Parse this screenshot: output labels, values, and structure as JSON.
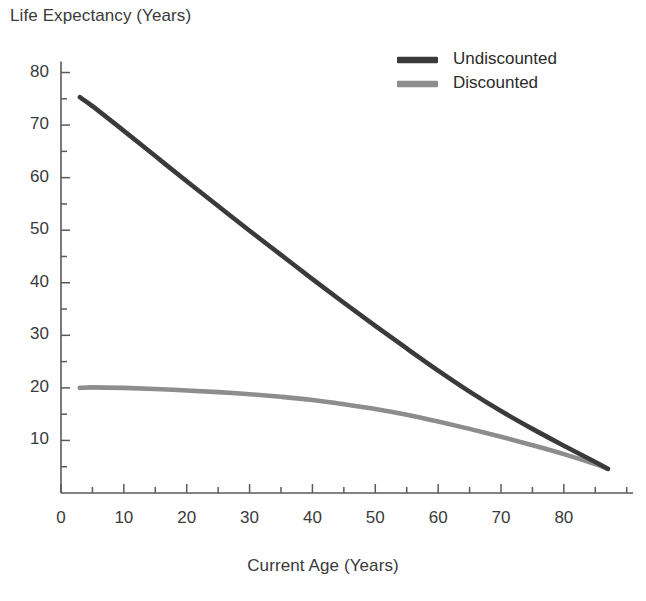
{
  "chart_data": {
    "type": "line",
    "title": "",
    "xlabel": "Current Age (Years)",
    "ylabel": "Life Expectancy (Years)",
    "xlim": [
      0,
      91
    ],
    "ylim": [
      0,
      82
    ],
    "xticks": [
      0,
      10,
      20,
      30,
      40,
      50,
      60,
      70,
      80
    ],
    "yticks": [
      10,
      20,
      30,
      40,
      50,
      60,
      70,
      80
    ],
    "xtick_minor_step": 5,
    "ytick_minor_step": 5,
    "grid": false,
    "legend_position": "top-right",
    "x": [
      3,
      5,
      10,
      15,
      20,
      25,
      30,
      35,
      40,
      45,
      50,
      55,
      60,
      65,
      70,
      75,
      80,
      85,
      87
    ],
    "series": [
      {
        "name": "Undiscounted",
        "color": "#3a3a3a",
        "values": [
          75.3,
          73.6,
          68.9,
          64.1,
          59.3,
          54.6,
          49.9,
          45.3,
          40.7,
          36.2,
          31.8,
          27.5,
          23.3,
          19.3,
          15.6,
          12.2,
          9.0,
          5.9,
          4.6
        ]
      },
      {
        "name": "Discounted",
        "color": "#8d8d8d",
        "values": [
          20.0,
          20.1,
          20.0,
          19.8,
          19.5,
          19.2,
          18.8,
          18.3,
          17.7,
          16.9,
          16.0,
          14.9,
          13.6,
          12.2,
          10.7,
          9.1,
          7.4,
          5.5,
          4.6
        ]
      }
    ]
  },
  "legend": {
    "items": [
      {
        "label": "Undiscounted",
        "color": "#3a3a3a"
      },
      {
        "label": "Discounted",
        "color": "#8d8d8d"
      }
    ]
  },
  "axes": {
    "y_tick_labels": [
      "80",
      "70",
      "60",
      "50",
      "40",
      "30",
      "20",
      "10"
    ],
    "x_tick_labels": [
      "0",
      "10",
      "20",
      "30",
      "40",
      "50",
      "60",
      "70",
      "80"
    ]
  }
}
